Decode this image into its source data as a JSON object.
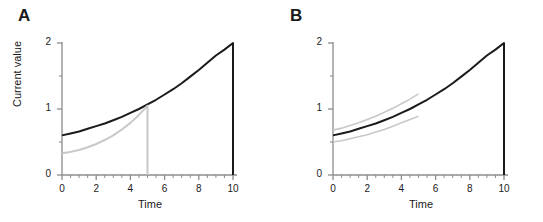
{
  "figure": {
    "panels": [
      {
        "label": "A",
        "xlabel": "Time",
        "ylabel": "Current value",
        "xticks": [
          "0",
          "2",
          "4",
          "6",
          "8",
          "10"
        ],
        "yticks": [
          "0",
          "1",
          "2"
        ]
      },
      {
        "label": "B",
        "xlabel": "Time",
        "ylabel": "",
        "xticks": [
          "0",
          "2",
          "4",
          "6",
          "8",
          "10"
        ],
        "yticks": [
          "0",
          "1",
          "2"
        ]
      }
    ]
  },
  "chart_data": [
    {
      "type": "line",
      "panel": "A",
      "title": "",
      "xlabel": "Time",
      "ylabel": "Current value",
      "xlim": [
        0,
        10
      ],
      "ylim": [
        0,
        2
      ],
      "xticks": [
        0,
        2,
        4,
        6,
        8,
        10
      ],
      "yticks": [
        0,
        1,
        2
      ],
      "xminorticks": [
        1,
        3,
        5,
        7,
        9
      ],
      "yminorticks": [
        0.5,
        1.5
      ],
      "grid": false,
      "legend": "none",
      "series": [
        {
          "name": "primary-accumulation",
          "color": "#1a1a1a",
          "linewidth": 2.0,
          "x": [
            0,
            0.5,
            1,
            1.5,
            2,
            2.5,
            3,
            3.5,
            4,
            4.5,
            5,
            5.5,
            6,
            6.5,
            7,
            7.5,
            8,
            8.5,
            9,
            9.5,
            10,
            10
          ],
          "y": [
            0.6,
            0.63,
            0.66,
            0.7,
            0.74,
            0.78,
            0.83,
            0.88,
            0.94,
            1.0,
            1.07,
            1.14,
            1.22,
            1.3,
            1.39,
            1.49,
            1.59,
            1.7,
            1.81,
            1.9,
            2.0,
            0.0
          ]
        },
        {
          "name": "reset-accumulation",
          "color": "#c8c8c8",
          "linewidth": 2.0,
          "x": [
            0,
            0.5,
            1,
            1.5,
            2,
            2.5,
            3,
            3.5,
            4,
            4.5,
            5,
            5
          ],
          "y": [
            0.33,
            0.35,
            0.38,
            0.42,
            0.47,
            0.53,
            0.6,
            0.69,
            0.79,
            0.91,
            1.05,
            0.0
          ]
        }
      ],
      "annotations": [
        {
          "text": "gray curve resets to zero at t = 5",
          "x": 5,
          "y": 1.05
        }
      ]
    },
    {
      "type": "line",
      "panel": "B",
      "title": "",
      "xlabel": "Time",
      "ylabel": "",
      "xlim": [
        0,
        10
      ],
      "ylim": [
        0,
        2
      ],
      "xticks": [
        0,
        2,
        4,
        6,
        8,
        10
      ],
      "yticks": [
        0,
        1,
        2
      ],
      "xminorticks": [
        1,
        3,
        5,
        7,
        9
      ],
      "yminorticks": [
        0.5,
        1.5
      ],
      "grid": false,
      "legend": "none",
      "series": [
        {
          "name": "primary-accumulation",
          "color": "#1a1a1a",
          "linewidth": 2.0,
          "x": [
            0,
            0.5,
            1,
            1.5,
            2,
            2.5,
            3,
            3.5,
            4,
            4.5,
            5,
            5.5,
            6,
            6.5,
            7,
            7.5,
            8,
            8.5,
            9,
            9.5,
            10,
            10
          ],
          "y": [
            0.6,
            0.63,
            0.66,
            0.7,
            0.74,
            0.78,
            0.83,
            0.88,
            0.94,
            1.0,
            1.07,
            1.14,
            1.22,
            1.3,
            1.39,
            1.49,
            1.59,
            1.7,
            1.81,
            1.9,
            2.0,
            0.0
          ]
        },
        {
          "name": "upper-bound",
          "color": "#c8c8c8",
          "linewidth": 1.6,
          "x": [
            0,
            0.5,
            1,
            1.5,
            2,
            2.5,
            3,
            3.5,
            4,
            4.5,
            5
          ],
          "y": [
            0.68,
            0.71,
            0.75,
            0.79,
            0.84,
            0.89,
            0.95,
            1.01,
            1.08,
            1.15,
            1.23
          ]
        },
        {
          "name": "lower-bound",
          "color": "#c8c8c8",
          "linewidth": 1.6,
          "x": [
            0,
            0.5,
            1,
            1.5,
            2,
            2.5,
            3,
            3.5,
            4,
            4.5,
            5
          ],
          "y": [
            0.5,
            0.52,
            0.55,
            0.58,
            0.61,
            0.65,
            0.69,
            0.74,
            0.79,
            0.84,
            0.89
          ]
        }
      ],
      "annotations": [
        {
          "text": "gray bounds terminate at t = 5",
          "x": 5,
          "y": 1.23
        }
      ]
    }
  ],
  "style": {
    "axis_color": "#8c8c8c",
    "text_color": "#1a1a1a",
    "primary_color": "#1a1a1a",
    "secondary_color": "#c8c8c8",
    "background": "#ffffff"
  }
}
